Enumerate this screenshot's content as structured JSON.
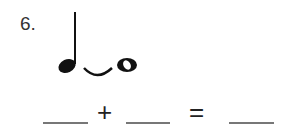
{
  "problem": {
    "number_label": "6.",
    "notation": {
      "notes": [
        "quarter-note",
        "eighth-rest-tie",
        "whole-note"
      ],
      "tie": true
    },
    "equation": {
      "blanks": [
        "",
        "",
        ""
      ],
      "plus_symbol": "+",
      "equals_symbol": "="
    }
  }
}
